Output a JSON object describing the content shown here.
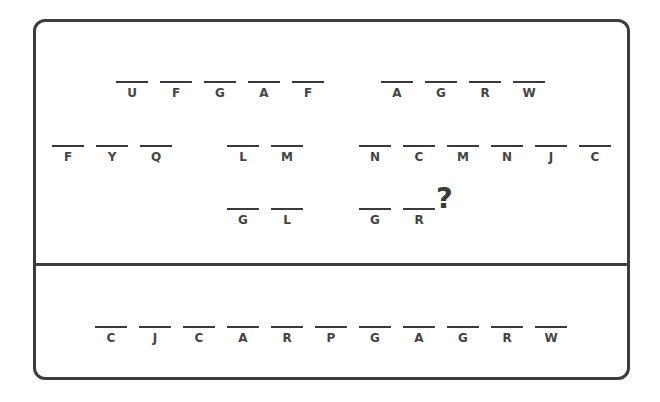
{
  "puzzle": {
    "question_mark": "?",
    "colors": {
      "border": "#3d3d3d",
      "letter": "#444444",
      "underline": "#3a3a3a",
      "background": "#ffffff"
    },
    "clue_groups": [
      {
        "id": "row1-left",
        "x": 116,
        "y": 81,
        "letters": [
          "U",
          "F",
          "G",
          "A",
          "F"
        ]
      },
      {
        "id": "row1-right",
        "x": 381,
        "y": 81,
        "letters": [
          "A",
          "G",
          "R",
          "W"
        ]
      },
      {
        "id": "row2-left",
        "x": 52,
        "y": 145,
        "letters": [
          "F",
          "Y",
          "Q"
        ]
      },
      {
        "id": "row2-mid",
        "x": 227,
        "y": 145,
        "letters": [
          "L",
          "M"
        ]
      },
      {
        "id": "row2-right",
        "x": 359,
        "y": 145,
        "letters": [
          "N",
          "C",
          "M",
          "N",
          "J",
          "C"
        ]
      },
      {
        "id": "row3-left",
        "x": 227,
        "y": 208,
        "letters": [
          "G",
          "L"
        ]
      },
      {
        "id": "row3-right",
        "x": 359,
        "y": 208,
        "letters": [
          "G",
          "R"
        ]
      }
    ],
    "answer_bank": {
      "x": 95,
      "y": 326,
      "letters": [
        "C",
        "J",
        "C",
        "A",
        "R",
        "P",
        "G",
        "A",
        "G",
        "R",
        "W"
      ]
    }
  }
}
